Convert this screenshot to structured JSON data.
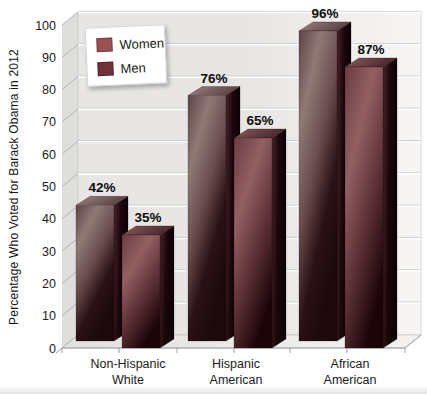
{
  "chart_data": {
    "type": "bar",
    "style": "3d-clustered",
    "title": "",
    "categories": [
      "Non-Hispanic White",
      "Hispanic American",
      "African American"
    ],
    "category_lines": [
      [
        "Non-Hispanic",
        "White"
      ],
      [
        "Hispanic",
        "American"
      ],
      [
        "African",
        "American"
      ]
    ],
    "series": [
      {
        "name": "Women",
        "values": [
          42,
          76,
          96
        ],
        "labels": [
          "42%",
          "76%",
          "96%"
        ],
        "color": "#9a5154"
      },
      {
        "name": "Men",
        "values": [
          35,
          65,
          87
        ],
        "labels": [
          "35%",
          "65%",
          "87%"
        ],
        "color": "#70323a"
      }
    ],
    "xlabel": "",
    "ylabel": "Percentage Who Voted for Barack Obama in 2012",
    "ylim": [
      0,
      100
    ],
    "ytick_step": 10,
    "ytick_labels": [
      "0",
      "10",
      "20",
      "30",
      "40",
      "50",
      "60",
      "70",
      "80",
      "90",
      "100"
    ],
    "grid": true,
    "legend_position": "top-left"
  },
  "colors": {
    "wall": "#e7e6e4",
    "wall_right": "#f7f6f4",
    "floor": "#e2e1df",
    "floor_right": "#f3f2f0",
    "side_wall": "#dededc",
    "gridline_light": "#ffffff",
    "gridline_dark": "#c6c5c3",
    "side_grid": "#b4b3b1",
    "axis_line": "#9f9e9c",
    "axis_text": "#1a1a1a",
    "value_label": "#0d0d0d",
    "women_front": [
      "#5d4547",
      "#8f7a77",
      "#6b4e4f",
      "#2a1115",
      "#1c090d"
    ],
    "men_front": [
      "#6b3c41",
      "#936062",
      "#5c3036",
      "#1c0509"
    ],
    "women_top": [
      "#9c8583",
      "#584042"
    ],
    "men_top": [
      "#8a5f60",
      "#47262b"
    ],
    "bar_side": [
      "#4a2429",
      "#1a070b",
      "#0d0205"
    ]
  }
}
